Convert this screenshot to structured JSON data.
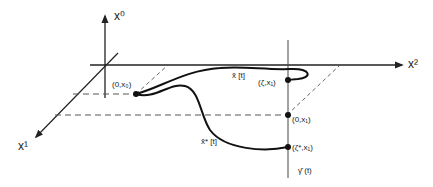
{
  "axes": {
    "x0": "x⁰",
    "x1": "x¹",
    "x2": "x²"
  },
  "curves": {
    "upper": "x̂ [t]",
    "lower": "x̂* [t]",
    "vertical": "γ̂ (t)"
  },
  "points": {
    "origin": "(0,x₀)",
    "upper_end": "(ζ,x₁)",
    "base": "(0,x₁)",
    "lower_end": "(ζ*,x₁)"
  },
  "colors": {
    "ink": "#222222",
    "dash": "#555555"
  }
}
